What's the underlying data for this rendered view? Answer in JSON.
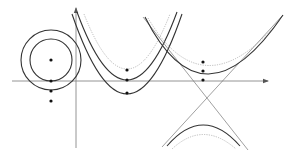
{
  "diagram": {
    "colors": {
      "background": "#ffffff",
      "curve": "#333333",
      "axis": "#888888",
      "dotted_curve": "#aaaaaa",
      "dot": "#111111"
    },
    "axes": {
      "horizontal": {
        "x1": 12,
        "y1": 81,
        "x2": 268,
        "y2": 81
      },
      "vertical": {
        "x1": 76,
        "y1": 148,
        "x2": 76,
        "y2": 8
      }
    },
    "circles": {
      "center": {
        "cx": 51,
        "cy": 60
      },
      "outer_radius": 30,
      "inner_radius": 21,
      "dots": [
        {
          "cx": 51,
          "cy": 60
        },
        {
          "cx": 51,
          "cy": 81
        },
        {
          "cx": 51,
          "cy": 91
        },
        {
          "cx": 51,
          "cy": 101
        }
      ]
    },
    "parabolas": {
      "vertex_x": 127,
      "curves": [
        {
          "style": "dotted",
          "d": "M 84 14 Q 127 124 170 14"
        },
        {
          "style": "solid",
          "d": "M 77 12 Q 127 148 177 12"
        },
        {
          "style": "solid",
          "d": "M 72 14 Q 127 174 182 14"
        }
      ],
      "dots": [
        {
          "cx": 127,
          "cy": 70
        },
        {
          "cx": 127,
          "cy": 80
        },
        {
          "cx": 127,
          "cy": 93
        }
      ]
    },
    "hyperbola": {
      "center": {
        "cx": 203,
        "cy": 102
      },
      "asymptotes": [
        {
          "x1": 143,
          "y1": 17,
          "x2": 248,
          "y2": 150
        },
        {
          "x1": 283,
          "y1": 15,
          "x2": 162,
          "y2": 147
        }
      ],
      "upper_curves": [
        {
          "style": "dotted",
          "d": "M 148 18 Q 203 112 280 20"
        },
        {
          "style": "solid",
          "d": "M 145 17 Q 203 132 283 15"
        }
      ],
      "lower_curves": [
        {
          "style": "solid",
          "d": "M 167 146 Q 203 104 240 146"
        },
        {
          "style": "dotted",
          "d": "M 172 149 Q 203 120 236 149"
        }
      ],
      "dots": [
        {
          "cx": 203,
          "cy": 62
        },
        {
          "cx": 203,
          "cy": 71
        },
        {
          "cx": 203,
          "cy": 80
        }
      ]
    }
  }
}
